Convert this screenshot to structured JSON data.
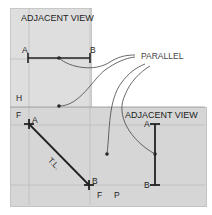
{
  "top_view": {
    "title": "ADJACENT VIEW",
    "plane_label": "H",
    "point_a": "A",
    "point_b": "B"
  },
  "front_view": {
    "plane_label_left": "F",
    "fold_label_f": "F",
    "fold_label_p": "P",
    "point_a": "A",
    "point_b": "B",
    "line_label": "T.L."
  },
  "side_view": {
    "title": "ADJACENT VIEW",
    "point_a": "A",
    "point_b": "B"
  },
  "callout": {
    "label": "PARALLEL"
  },
  "colors": {
    "panel_fill": "#dcdcdc",
    "panel_fill_dark": "#d2d2d2",
    "line": "#222222",
    "grid": "#bdbdbd"
  }
}
